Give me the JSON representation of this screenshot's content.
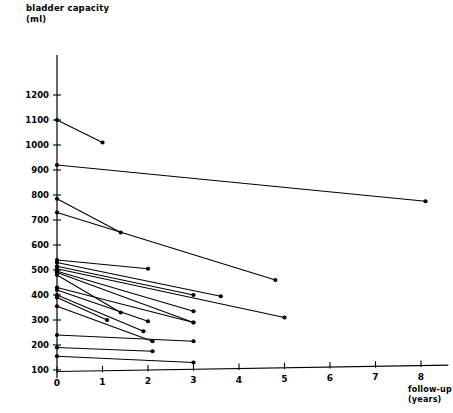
{
  "chart_data": {
    "type": "line",
    "title": "bladder capacity\n(ml)",
    "ylabel": "bladder capacity (ml)",
    "xlabel": "follow-up\n(years)",
    "xlabel_text": "follow-up (years)",
    "grid": false,
    "legend": "none",
    "xlim": [
      0,
      8.6
    ],
    "ylim": [
      80,
      1240
    ],
    "xticks": [
      0,
      1,
      2,
      3,
      4,
      5,
      6,
      7,
      8
    ],
    "xtick_labels": [
      "0",
      "1",
      "2",
      "3",
      "4",
      "5",
      "6",
      "7",
      "8"
    ],
    "yticks": [
      100,
      200,
      300,
      400,
      500,
      600,
      700,
      800,
      900,
      1000,
      1100,
      1200
    ],
    "ytick_labels": [
      "100",
      "200",
      "300",
      "400",
      "500",
      "600",
      "700",
      "800",
      "900",
      "1000",
      "1100",
      "1200"
    ],
    "marker": "filled-circle",
    "series": [
      {
        "name": "patient-01",
        "x": [
          0.0,
          1.0
        ],
        "y": [
          1100,
          1010
        ]
      },
      {
        "name": "patient-02",
        "x": [
          0.0,
          8.1
        ],
        "y": [
          920,
          775
        ]
      },
      {
        "name": "patient-03",
        "x": [
          0.0,
          1.4
        ],
        "y": [
          785,
          650
        ]
      },
      {
        "name": "patient-04",
        "x": [
          0.0,
          4.8
        ],
        "y": [
          730,
          460
        ]
      },
      {
        "name": "patient-05",
        "x": [
          0.0,
          2.0
        ],
        "y": [
          540,
          505
        ]
      },
      {
        "name": "patient-06",
        "x": [
          0.0,
          3.6
        ],
        "y": [
          530,
          395
        ]
      },
      {
        "name": "patient-07",
        "x": [
          0.0,
          3.0
        ],
        "y": [
          515,
          400
        ]
      },
      {
        "name": "patient-08",
        "x": [
          0.0,
          5.0
        ],
        "y": [
          505,
          310
        ]
      },
      {
        "name": "patient-09",
        "x": [
          0.0,
          3.0
        ],
        "y": [
          495,
          335
        ]
      },
      {
        "name": "patient-10",
        "x": [
          0.0,
          3.0
        ],
        "y": [
          490,
          290
        ]
      },
      {
        "name": "patient-11",
        "x": [
          0.0,
          1.4
        ],
        "y": [
          480,
          330
        ]
      },
      {
        "name": "patient-12",
        "x": [
          0.0,
          3.0
        ],
        "y": [
          430,
          290
        ]
      },
      {
        "name": "patient-13",
        "x": [
          0.0,
          2.0
        ],
        "y": [
          420,
          295
        ]
      },
      {
        "name": "patient-14",
        "x": [
          0.0,
          1.9
        ],
        "y": [
          400,
          255
        ]
      },
      {
        "name": "patient-15",
        "x": [
          0.0,
          1.1
        ],
        "y": [
          390,
          300
        ]
      },
      {
        "name": "patient-16",
        "x": [
          0.0,
          2.1
        ],
        "y": [
          355,
          215
        ]
      },
      {
        "name": "patient-17",
        "x": [
          0.0,
          3.0
        ],
        "y": [
          240,
          215
        ]
      },
      {
        "name": "patient-18",
        "x": [
          0.0,
          2.1
        ],
        "y": [
          190,
          175
        ]
      },
      {
        "name": "patient-19",
        "x": [
          0.0,
          3.0
        ],
        "y": [
          155,
          130
        ]
      }
    ]
  }
}
